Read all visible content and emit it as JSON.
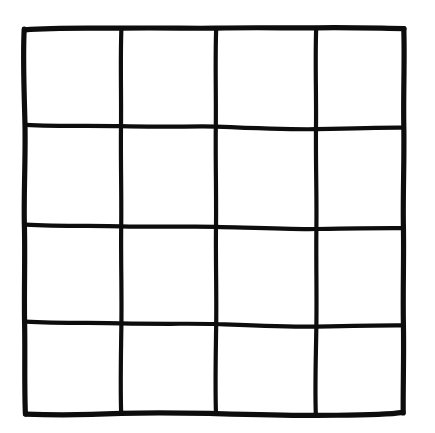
{
  "image": {
    "title": "Hand-drawn square grid",
    "description": "A freehand ink drawing of a 4 by 4 grid of squares forming a large square outline",
    "width": 435,
    "height": 433,
    "background_color": "#ffffff",
    "ink_color": "#0d0d0d",
    "medium": "black marker on white paper",
    "style": "hand-drawn, slightly wavy lines"
  },
  "grid": {
    "rows": 4,
    "columns": 4,
    "cell_count": 16,
    "horizontal_line_count": 5,
    "vertical_line_count": 5,
    "stroke_width_outer": 5.2,
    "stroke_width_inner": 4.2,
    "bounds": {
      "left": 24,
      "top": 28,
      "right": 404,
      "bottom": 413
    },
    "horizontal_line_positions_y": [
      29,
      126,
      226,
      323,
      413
    ],
    "vertical_line_positions_x": [
      24,
      121,
      216,
      316,
      404
    ],
    "horizontal_lines": [
      {
        "name": "top-edge",
        "index": 0,
        "outer": true,
        "path": "M 24.5 29.8 C 60 27.2, 96 28.4, 121 28.2 C 160 27.6, 196 28.6, 216 28.1 C 258 27.2, 292 28.2, 316 27.8 C 352 27.2, 382 28.4, 404 28.6"
      },
      {
        "name": "inner-horizontal-1",
        "index": 1,
        "outer": false,
        "path": "M 25.5 124.8 C 60 126.6, 96 125.4, 121 126.2 C 160 127.4, 196 126.0, 216 126.6 C 258 128.4, 292 129.6, 316 129.2 C 352 128.2, 382 127.4, 403 127.6"
      },
      {
        "name": "inner-horizontal-2",
        "index": 2,
        "outer": false,
        "path": "M 25.5 224.6 C 60 226.4, 96 225.6, 121 226.4 C 160 227.2, 196 226.2, 216 226.8 C 258 228.0, 292 229.4, 316 229.0 C 352 228.4, 382 228.0, 403 228.2"
      },
      {
        "name": "inner-horizontal-3",
        "index": 3,
        "outer": false,
        "path": "M 25.5 321.6 C 60 323.4, 96 322.6, 121 323.4 C 160 324.2, 196 323.4, 216 324.0 C 258 325.6, 292 327.0, 316 326.6 C 352 325.8, 382 325.2, 403 325.4"
      },
      {
        "name": "bottom-edge",
        "index": 4,
        "outer": true,
        "path": "M 25.5 414.2 C 60 415.4, 96 414.6, 121 413.4 C 160 412.2, 196 413.2, 216 413.6 C 258 414.8, 292 415.6, 316 415.4 C 352 415.0, 382 415.6, 403 412.4"
      }
    ],
    "vertical_lines": [
      {
        "name": "left-edge",
        "index": 0,
        "outer": true,
        "path": "M 24.2 29.2 C 22.6 60, 24.4 96, 25.0 126 C 25.6 160, 23.6 196, 24.4 226 C 25.2 258, 24.0 292, 24.6 323 C 25.2 355, 24.2 385, 25.4 414"
      },
      {
        "name": "inner-vertical-1",
        "index": 1,
        "outer": false,
        "path": "M 121.4 28.4 C 120.2 60, 121.4 96, 121.0 126 C 120.6 160, 121.6 196, 121.2 226 C 120.8 258, 121.8 292, 121.4 323 C 121.0 355, 120.2 385, 121.2 414"
      },
      {
        "name": "inner-vertical-2",
        "index": 2,
        "outer": false,
        "path": "M 216.2 28.2 C 215.0 60, 216.2 96, 215.8 126 C 215.4 160, 216.4 196, 216.0 226 C 215.6 258, 216.6 292, 216.2 323 C 215.8 355, 215.0 385, 216.0 414"
      },
      {
        "name": "inner-vertical-3",
        "index": 3,
        "outer": false,
        "path": "M 316.2 27.8 C 315.0 60, 316.4 96, 316.0 126 C 315.6 160, 316.8 196, 316.4 226 C 316.0 258, 316.8 292, 316.4 323 C 316.0 355, 314.8 385, 315.8 414"
      },
      {
        "name": "right-edge",
        "index": 4,
        "outer": true,
        "path": "M 403.8 28.6 C 404.8 60, 403.2 96, 403.8 126 C 404.4 160, 402.8 196, 403.4 226 C 404.0 258, 402.8 292, 403.4 323 C 404.0 355, 403.0 385, 403.2 413"
      }
    ],
    "cells": [
      {
        "row": 0,
        "col": 0,
        "label": "r1c1"
      },
      {
        "row": 0,
        "col": 1,
        "label": "r1c2"
      },
      {
        "row": 0,
        "col": 2,
        "label": "r1c3"
      },
      {
        "row": 0,
        "col": 3,
        "label": "r1c4"
      },
      {
        "row": 1,
        "col": 0,
        "label": "r2c1"
      },
      {
        "row": 1,
        "col": 1,
        "label": "r2c2"
      },
      {
        "row": 1,
        "col": 2,
        "label": "r2c3"
      },
      {
        "row": 1,
        "col": 3,
        "label": "r2c4"
      },
      {
        "row": 2,
        "col": 0,
        "label": "r3c1"
      },
      {
        "row": 2,
        "col": 1,
        "label": "r3c2"
      },
      {
        "row": 2,
        "col": 2,
        "label": "r3c3"
      },
      {
        "row": 2,
        "col": 3,
        "label": "r3c4"
      },
      {
        "row": 3,
        "col": 0,
        "label": "r4c1"
      },
      {
        "row": 3,
        "col": 1,
        "label": "r4c2"
      },
      {
        "row": 3,
        "col": 2,
        "label": "r4c3"
      },
      {
        "row": 3,
        "col": 3,
        "label": "r4c4"
      }
    ]
  }
}
